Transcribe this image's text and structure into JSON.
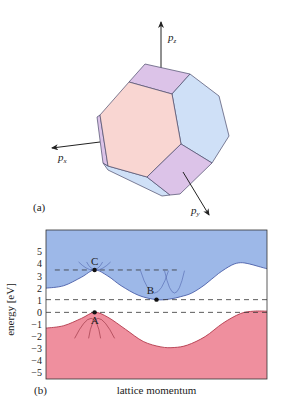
{
  "panel_a": {
    "label": "(a)",
    "axes": [
      {
        "name": "pz",
        "base": "p",
        "sub": "z",
        "direction": "up"
      },
      {
        "name": "px",
        "base": "p",
        "sub": "x",
        "direction": "left"
      },
      {
        "name": "py",
        "base": "p",
        "sub": "y",
        "direction": "down-right"
      }
    ],
    "face_colors": {
      "hexagon_front": "#f9d6d2",
      "hexagon_right": "#cfe0f7",
      "square": "#dcc3e8",
      "edge": "#4a4a6a"
    }
  },
  "panel_b": {
    "label": "(b)",
    "colors": {
      "conduction": "#9db8e8",
      "valence": "#ef8f9e",
      "conduction_edge": "#4b5fa8",
      "valence_edge": "#b23a4c",
      "dashed": "#333333"
    }
  },
  "chart_data": {
    "type": "area",
    "title": "",
    "xlabel": "lattice momentum",
    "ylabel": "energy [eV]",
    "ylim": [
      -5.5,
      6.8
    ],
    "xlim": [
      0,
      1
    ],
    "yticks": [
      5,
      4,
      3,
      2,
      1,
      0,
      -1,
      -2,
      -3,
      -4,
      -5
    ],
    "ytick_labels": [
      "5",
      "4",
      "3",
      "2",
      "1",
      "0",
      "−1",
      "−2",
      "−3",
      "−4",
      "−5"
    ],
    "grid": false,
    "series": [
      {
        "name": "conduction band",
        "fill": "above",
        "x": [
          0,
          0.08,
          0.16,
          0.22,
          0.28,
          0.34,
          0.42,
          0.5,
          0.56,
          0.61,
          0.66,
          0.72,
          0.78,
          0.84,
          0.88,
          0.92,
          0.96,
          1.0
        ],
        "y": [
          2.0,
          2.2,
          2.9,
          3.5,
          3.0,
          2.2,
          1.4,
          1.05,
          1.1,
          1.3,
          1.6,
          2.3,
          3.2,
          3.9,
          4.1,
          4.0,
          3.8,
          3.6
        ]
      },
      {
        "name": "valence band",
        "fill": "below",
        "x": [
          0,
          0.08,
          0.16,
          0.22,
          0.28,
          0.36,
          0.44,
          0.52,
          0.58,
          0.64,
          0.72,
          0.8,
          0.88,
          0.94,
          1.0
        ],
        "y": [
          -1.3,
          -1.1,
          -0.5,
          0.0,
          -0.4,
          -1.4,
          -2.4,
          -2.85,
          -2.9,
          -2.7,
          -2.0,
          -0.9,
          -0.1,
          0.1,
          0.1
        ]
      }
    ],
    "reference_lines": [
      {
        "name": "C level",
        "y": 3.5,
        "x_range": [
          0.04,
          0.6
        ],
        "style": "dashed"
      },
      {
        "name": "B level",
        "y": 1.05,
        "x_range": [
          0,
          1
        ],
        "style": "dashed"
      },
      {
        "name": "A level",
        "y": 0.0,
        "x_range": [
          0,
          1
        ],
        "style": "dashed"
      }
    ],
    "points": [
      {
        "label": "A",
        "x": 0.22,
        "y": 0.0,
        "label_pos": "below"
      },
      {
        "label": "B",
        "x": 0.5,
        "y": 1.05,
        "label_pos": "above-left"
      },
      {
        "label": "C",
        "x": 0.22,
        "y": 3.5,
        "label_pos": "above"
      }
    ],
    "local_parabolas": [
      {
        "at": "A",
        "orientation": "down",
        "count": 2
      },
      {
        "at": "C",
        "orientation": "up",
        "count": 2
      },
      {
        "at": "B",
        "orientation": "up",
        "count": 2
      }
    ]
  }
}
